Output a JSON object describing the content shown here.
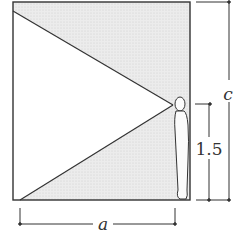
{
  "diagram": {
    "type": "geometry-figure",
    "labels": {
      "width": "a",
      "height": "c",
      "eye_height": "1.5"
    },
    "colors": {
      "line": "#333333",
      "shade": "#e4e4e4",
      "background": "#ffffff"
    }
  }
}
